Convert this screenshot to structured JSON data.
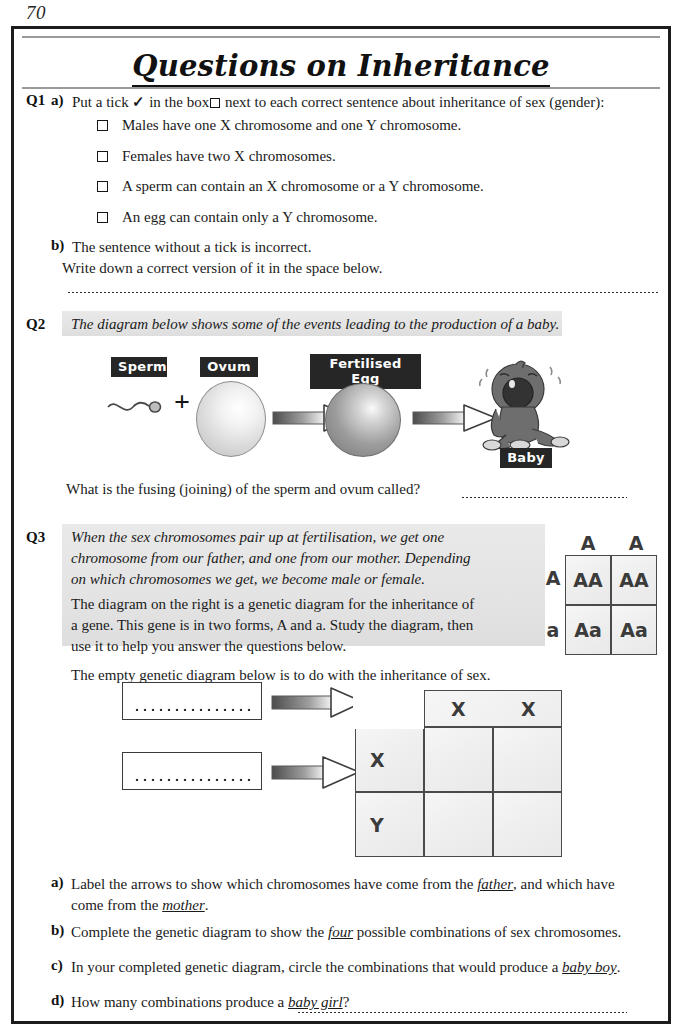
{
  "page": {
    "number": "70",
    "title": "Questions on Inheritance"
  },
  "q1": {
    "label": "Q1",
    "part_a": "a)",
    "stem_pre": "Put a tick",
    "tick_glyph": "✓",
    "stem_mid": "in the box",
    "stem_post": "next to each correct sentence about inheritance of sex (gender):",
    "options": [
      "Males have one X chromosome and one Y chromosome.",
      "Females have two X chromosomes.",
      "A sperm can contain an X chromosome or a Y chromosome.",
      "An egg can contain only a Y chromosome."
    ],
    "part_b": "b)",
    "b_line1": "The sentence without a tick is incorrect.",
    "b_line2": "Write down a correct version of it in the space below."
  },
  "q2": {
    "label": "Q2",
    "intro": "The diagram below shows some of the events leading to the production of a baby.",
    "tags": {
      "sperm": "Sperm",
      "ovum": "Ovum",
      "fertilised_egg": "Fertilised Egg",
      "baby": "Baby"
    },
    "plus": "+",
    "question": "What is the fusing (joining) of the sperm and ovum called?"
  },
  "q3": {
    "label": "Q3",
    "italic_lines": [
      "When the sex chromosomes pair up at fertilisation, we get one",
      "chromosome from our father, and one from our mother.  Depending",
      "on which chromosomes we get, we become male or female."
    ],
    "roman_lines": [
      "The diagram on the right is a genetic diagram for the inheritance of",
      "a gene.  This gene is in two forms, A and a.  Study the diagram, then",
      "use it to help you answer the questions below."
    ],
    "below_note": "The empty genetic diagram below is to do with the inheritance of sex.",
    "example_grid": {
      "top_labels": [
        "A",
        "A"
      ],
      "side_labels": [
        "A",
        "a"
      ],
      "cells": [
        [
          "AA",
          "AA"
        ],
        [
          "Aa",
          "Aa"
        ]
      ]
    },
    "empty_grid": {
      "top_labels": [
        "X",
        "X"
      ],
      "side_labels": [
        "X",
        "Y"
      ],
      "cells": [
        [
          "",
          ""
        ],
        [
          "",
          ""
        ]
      ]
    },
    "parts": [
      {
        "letter": "a)",
        "lines": [
          "Label the arrows to show which chromosomes have come from the |father|, and which have",
          "come from the |mother|."
        ]
      },
      {
        "letter": "b)",
        "lines": [
          "Complete the genetic diagram to show the |four| possible combinations of sex chromosomes."
        ]
      },
      {
        "letter": "c)",
        "lines": [
          "In your completed genetic diagram, circle the combinations that would produce a |baby boy|."
        ]
      },
      {
        "letter": "d)",
        "lines": [
          "How many combinations produce a |baby girl|?"
        ]
      }
    ]
  },
  "colors": {
    "ink": "#1a1a1a",
    "border": "#1c1c1c",
    "shade": "#e6e6e6",
    "tag_bg": "#262626",
    "grid_line": "#4a4a4a"
  }
}
